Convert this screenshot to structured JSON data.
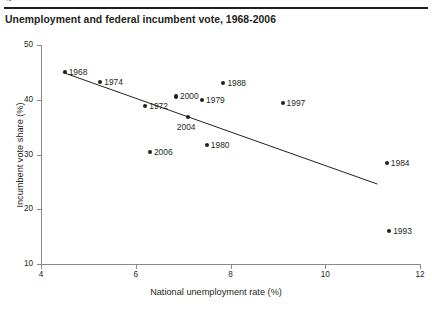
{
  "top_partial_caption": "g",
  "chart_data": {
    "type": "scatter",
    "title": "Unemployment and federal incumbent vote, 1968-2006",
    "xlabel": "National unemployment rate (%)",
    "ylabel": "Incumbent vote share (%)",
    "xlim": [
      4,
      12
    ],
    "ylim": [
      10,
      50
    ],
    "xticks": [
      "4",
      "6",
      "8",
      "10",
      "12"
    ],
    "yticks": [
      "10",
      "20",
      "30",
      "40",
      "50"
    ],
    "grid": false,
    "legend": "none",
    "points": [
      {
        "label": "1968",
        "x": 4.5,
        "y": 45.0,
        "label_pos": "right"
      },
      {
        "label": "1974",
        "x": 5.25,
        "y": 43.2,
        "label_pos": "right"
      },
      {
        "label": "1972",
        "x": 6.2,
        "y": 38.9,
        "label_pos": "right"
      },
      {
        "label": "2006",
        "x": 6.3,
        "y": 30.5,
        "label_pos": "right"
      },
      {
        "label": "2000",
        "x": 6.85,
        "y": 40.6,
        "label_pos": "right"
      },
      {
        "label": "2004",
        "x": 7.1,
        "y": 36.8,
        "label_pos": "below"
      },
      {
        "label": "1979",
        "x": 7.4,
        "y": 39.9,
        "label_pos": "right"
      },
      {
        "label": "1980",
        "x": 7.5,
        "y": 31.8,
        "label_pos": "right"
      },
      {
        "label": "1988",
        "x": 7.85,
        "y": 43.0,
        "label_pos": "right"
      },
      {
        "label": "1997",
        "x": 9.1,
        "y": 39.4,
        "label_pos": "right"
      },
      {
        "label": "1984",
        "x": 11.3,
        "y": 28.4,
        "label_pos": "right"
      },
      {
        "label": "1993",
        "x": 11.35,
        "y": 16.1,
        "label_pos": "right"
      }
    ],
    "trendline": {
      "x0": 4.46,
      "y0": 45.0,
      "x1": 11.1,
      "y1": 24.6,
      "color": "#231f20"
    }
  }
}
